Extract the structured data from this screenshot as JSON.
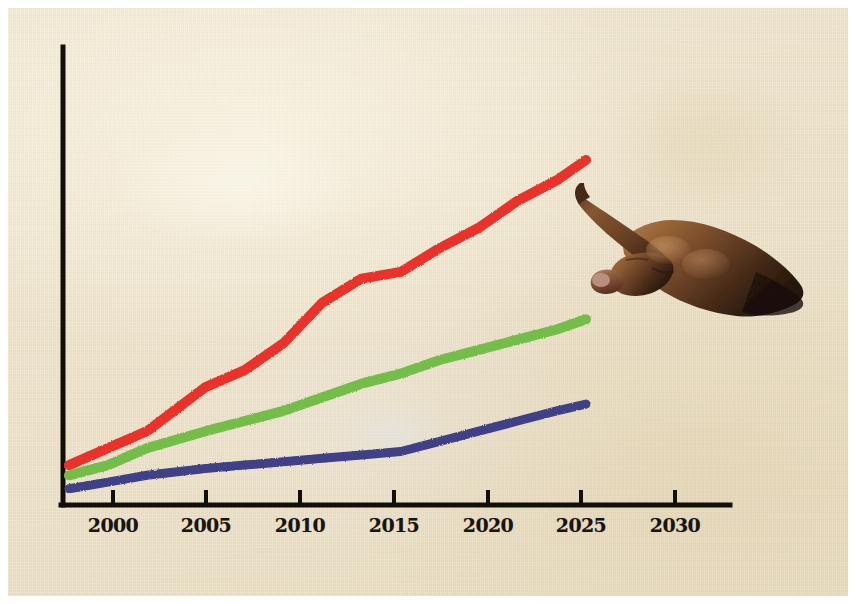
{
  "figure": {
    "kind": "hand-drawn line chart collage on textured paper",
    "background_color": "#ece0c4",
    "axis_color": "#120f0b",
    "border_color": "#ffffff"
  },
  "axes": {
    "origin_x": 55,
    "origin_y": 497,
    "x_axis_end": 722,
    "y_axis_top": 39,
    "tick_length": 13
  },
  "overlay": {
    "hand": {
      "icon": "pointing-hand-photo",
      "description": "photographic cut-out of a right hand with index finger extended, pointing left at the end of the red line",
      "skin_dark": "#3a2417",
      "skin_mid": "#7b4f2e",
      "skin_light": "#a9754a",
      "nail": "#c79a8c"
    }
  },
  "chart_data": {
    "type": "line",
    "title": "",
    "subtitle": "",
    "xlabel": "",
    "ylabel": "",
    "grid": false,
    "legend": "none",
    "xlim": [
      1997,
      2033
    ],
    "ylim": [
      0,
      100
    ],
    "x_ticks": [
      2000,
      2005,
      2010,
      2015,
      2020,
      2025,
      2030
    ],
    "x_tick_labels": [
      "2000",
      "2005",
      "2010",
      "2015",
      "2020",
      "2025",
      "2030"
    ],
    "y_ticks": [],
    "y_tick_labels": [],
    "x": [
      1998,
      2000,
      2002,
      2005,
      2007,
      2009,
      2011,
      2013,
      2015,
      2017,
      2019,
      2021,
      2023,
      2024.5
    ],
    "series": [
      {
        "name": "red-line",
        "color": "#e8332a",
        "label": "",
        "values": [
          10,
          15,
          20,
          33,
          38,
          46,
          58,
          65,
          67,
          74,
          80,
          88,
          94,
          100
        ]
      },
      {
        "name": "green-line",
        "color": "#74bd4a",
        "label": "",
        "values": [
          7,
          10,
          15,
          20,
          23,
          26,
          30,
          34,
          37,
          41,
          44,
          47,
          50,
          53
        ]
      },
      {
        "name": "blue-line",
        "color": "#3f3f87",
        "label": "",
        "values": [
          3,
          5,
          7,
          9,
          10,
          11,
          12,
          13,
          14,
          17,
          20,
          23,
          26,
          28
        ]
      }
    ]
  }
}
